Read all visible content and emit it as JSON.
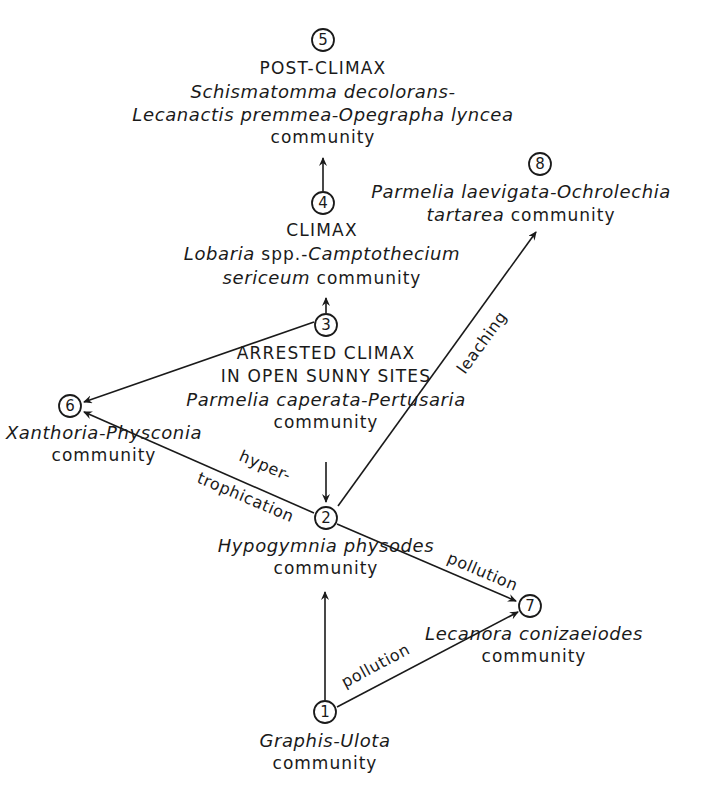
{
  "diagram": {
    "type": "lichen succession pathway",
    "nodes": [
      {
        "id": "1",
        "number": "1",
        "heading": "",
        "line1": "Graphis-Ulota",
        "line2_italic": "",
        "line2_plain": "community"
      },
      {
        "id": "2",
        "number": "2",
        "heading": "",
        "line1": "Hypogymnia physodes",
        "line2_italic": "",
        "line2_plain": "community"
      },
      {
        "id": "3",
        "number": "3",
        "heading1": "ARRESTED CLIMAX",
        "heading2": "IN OPEN SUNNY SITES",
        "line1": "Parmelia caperata-Pertusaria",
        "line2_plain": "community"
      },
      {
        "id": "4",
        "number": "4",
        "heading": "CLIMAX",
        "line1_italic": "Lobaria",
        "line1_plain": " spp.-",
        "line1_italic2": "Camptothecium",
        "line2_italic": "sericeum",
        "line2_plain": " community"
      },
      {
        "id": "5",
        "number": "5",
        "heading": "POST-CLIMAX",
        "line1": "Schismatomma decolorans-",
        "line2": "Lecanactis premmea-Opegrapha lyncea",
        "line3_plain": "community"
      },
      {
        "id": "6",
        "number": "6",
        "line1": "Xanthoria-Physconia",
        "line2_plain": "community"
      },
      {
        "id": "7",
        "number": "7",
        "line1": "Lecanora conizaeiodes",
        "line2_plain": "community"
      },
      {
        "id": "8",
        "number": "8",
        "line1": "Parmelia laevigata-Ochrolechia",
        "line2_italic": "tartarea",
        "line2_plain": " community"
      }
    ],
    "edges": [
      {
        "from": "1",
        "to": "2",
        "label": ""
      },
      {
        "from": "1",
        "to": "7",
        "label": "pollution"
      },
      {
        "from": "2",
        "to": "7",
        "label": "pollution"
      },
      {
        "from": "2",
        "to": "6",
        "label": "hyper-\ntrophication",
        "label_line1": "hyper-",
        "label_line2": "trophication"
      },
      {
        "from": "2",
        "to": "8",
        "label": "leaching"
      },
      {
        "from": "3",
        "to": "2",
        "label": ""
      },
      {
        "from": "3",
        "to": "4",
        "label": ""
      },
      {
        "from": "3",
        "to": "6",
        "label": ""
      },
      {
        "from": "4",
        "to": "5",
        "label": ""
      }
    ],
    "colors": {
      "ink": "#1a1a1a",
      "background": "#ffffff"
    }
  }
}
